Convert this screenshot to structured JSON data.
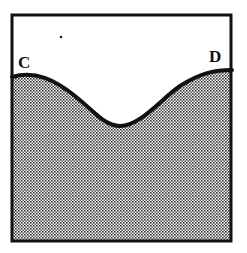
{
  "diagram": {
    "labels": {
      "left": "C",
      "right": "D"
    },
    "colors": {
      "border": "#111111",
      "fill_dots": "#222222",
      "background": "#ffffff"
    }
  }
}
